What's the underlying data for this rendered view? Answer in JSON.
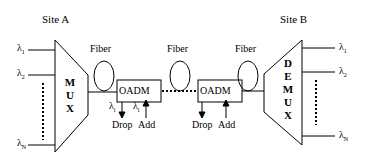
{
  "diagram": {
    "site_a": {
      "label": "Site A"
    },
    "site_b": {
      "label": "Site B"
    },
    "mux": {
      "letters": [
        "M",
        "U",
        "X"
      ]
    },
    "demux": {
      "letters": [
        "D",
        "E",
        "M",
        "U",
        "X"
      ]
    },
    "fiber_labels": [
      "Fiber",
      "Fiber",
      "Fiber"
    ],
    "oadm": [
      {
        "label": "OADM",
        "drop": "Drop",
        "add": "Add",
        "drop_lambda": "λ",
        "drop_lambda_sub": "i",
        "add_lambda": "λ",
        "add_lambda_sub": "i"
      },
      {
        "label": "OADM",
        "drop": "Drop",
        "add": "Add"
      }
    ],
    "inputs": [
      {
        "symbol": "λ",
        "sub": "1"
      },
      {
        "symbol": "λ",
        "sub": "2"
      },
      {
        "symbol": "λ",
        "sub": "N"
      }
    ],
    "outputs": [
      {
        "symbol": "λ",
        "sub": "1"
      },
      {
        "symbol": "λ",
        "sub": "2"
      },
      {
        "symbol": "λ",
        "sub": "N"
      }
    ]
  }
}
